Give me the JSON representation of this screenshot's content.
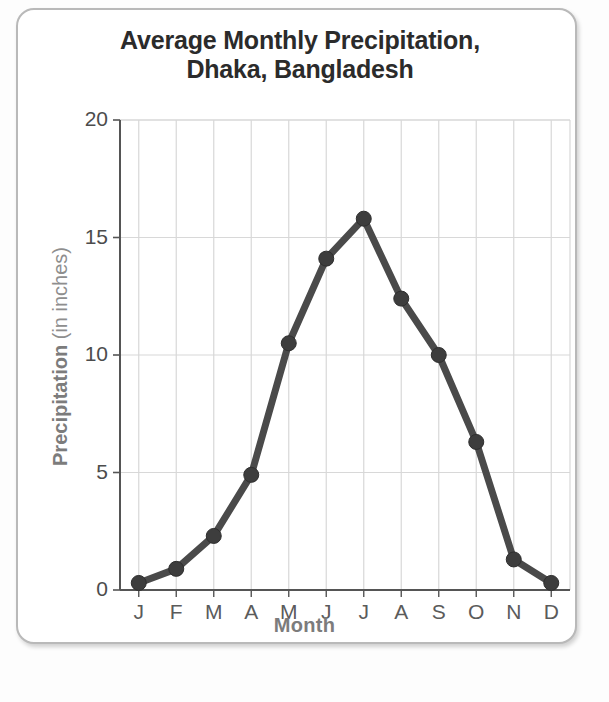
{
  "figure": {
    "title_line1": "Average Monthly Precipitation,",
    "title_line2": "Dhaka, Bangladesh",
    "yaxis_title_strong": "Precipitation",
    "yaxis_title_light": "(in inches)",
    "xaxis_title": "Month"
  },
  "chart_data": {
    "type": "line",
    "title": "Average Monthly Precipitation, Dhaka, Bangladesh",
    "xlabel": "Month",
    "ylabel": "Precipitation (in inches)",
    "categories": [
      "J",
      "F",
      "M",
      "A",
      "M",
      "J",
      "J",
      "A",
      "S",
      "O",
      "N",
      "D"
    ],
    "category_names": [
      "January",
      "February",
      "March",
      "April",
      "May",
      "June",
      "July",
      "August",
      "September",
      "October",
      "November",
      "December"
    ],
    "values": [
      0.3,
      0.9,
      2.3,
      4.9,
      10.5,
      14.1,
      15.8,
      12.4,
      10.0,
      6.3,
      1.3,
      0.3
    ],
    "ylim": [
      0,
      20
    ],
    "yticks": [
      0,
      5,
      10,
      15,
      20
    ],
    "ytick_labels": [
      "0",
      "5",
      "10",
      "15",
      "20"
    ],
    "grid": true,
    "grid_axis": "both",
    "legend": false,
    "markers": true,
    "series": [
      {
        "name": "Average monthly precipitation",
        "values": [
          0.3,
          0.9,
          2.3,
          4.9,
          10.5,
          14.1,
          15.8,
          12.4,
          10.0,
          6.3,
          1.3,
          0.3
        ]
      }
    ]
  },
  "style": {
    "line_color": "#4a4a4a",
    "marker_color": "#3d3d3d",
    "grid_color": "#d8d8d8",
    "axis_color": "#555555",
    "title_color": "#2b2b2b",
    "label_color": "#7c7c7c",
    "frame_color": "#b9b9b9",
    "background": "#ffffff"
  }
}
